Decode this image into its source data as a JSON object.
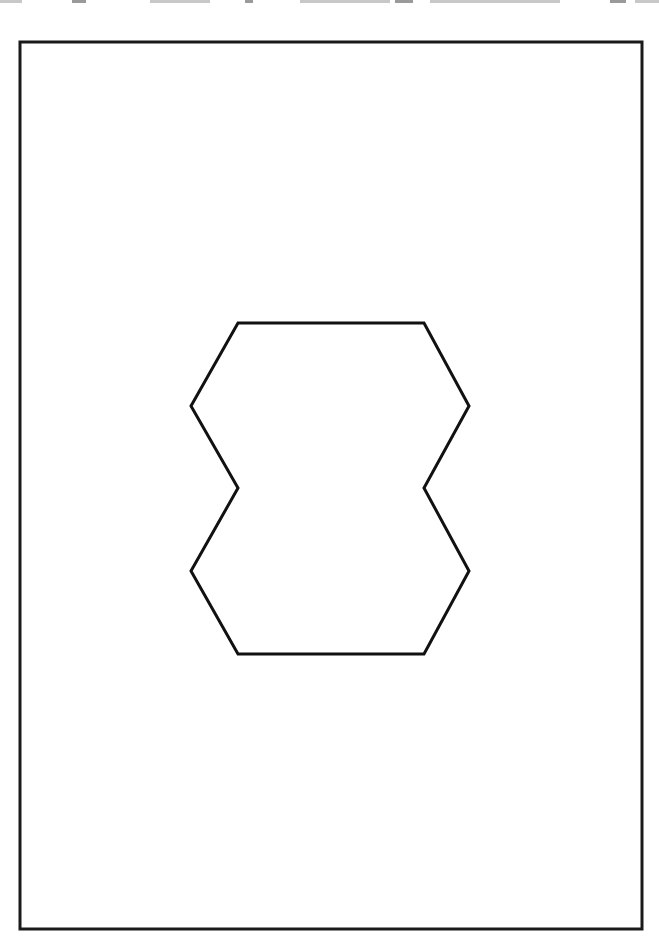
{
  "page": {
    "width": 659,
    "height": 938,
    "background": "#ffffff"
  },
  "frame": {
    "x": 20,
    "y": 42,
    "width": 622,
    "height": 887,
    "stroke": "#1a1a1a",
    "stroke_width": 3
  },
  "figure": {
    "shape": "double-hexagon outline",
    "stroke": "#111111",
    "stroke_width": 3,
    "fill": "none",
    "points": [
      [
        238,
        323
      ],
      [
        424,
        323
      ],
      [
        469,
        406
      ],
      [
        424,
        488
      ],
      [
        469,
        571
      ],
      [
        424,
        654
      ],
      [
        238,
        654
      ],
      [
        191,
        571
      ],
      [
        238,
        488
      ],
      [
        191,
        406
      ]
    ]
  }
}
